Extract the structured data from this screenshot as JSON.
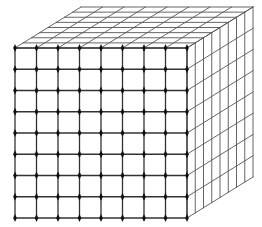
{
  "figure": {
    "title": "",
    "grid_divisions": 8,
    "colors": {
      "background": "#ffffff",
      "front_lines": "#333333",
      "face_lines": "#555555",
      "nodes": "#111111"
    },
    "geometry": {
      "front_face": {
        "x0": 15,
        "y0": 48,
        "x1": 187,
        "y1": 218
      },
      "depth_offset": {
        "dx": 66,
        "dy": -41
      }
    }
  }
}
